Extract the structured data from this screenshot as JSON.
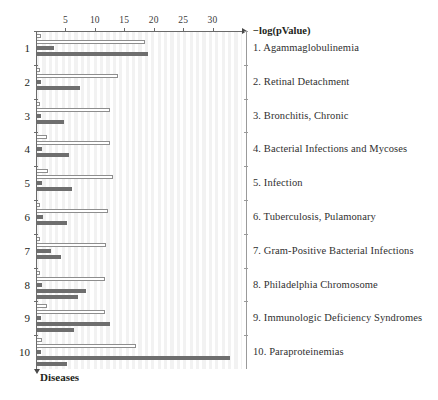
{
  "chart_data": {
    "type": "bar",
    "orientation": "horizontal",
    "title": "",
    "xlabel": "−log(pValue)",
    "ylabel": "Diseases",
    "xlim": [
      0,
      35
    ],
    "xticks": [
      5,
      10,
      15,
      20,
      25,
      30
    ],
    "grid": true,
    "grid_style": "vertical-stripes",
    "legend_position": "right-as-category-list",
    "categories": [
      "1. Agammaglobulinemia",
      "2. Retinal Detachment",
      "3. Bronchitis, Chronic",
      "4. Bacterial Infections and Mycoses",
      "5. Infection",
      "6. Tuberculosis, Pulamonary",
      "7. Gram-Positive Bacterial Infections",
      "8. Philadelphia Chromosome",
      "9. Immunologic Deficiency Syndromes",
      "10. Paraproteinemias"
    ],
    "group_numbers": [
      "1",
      "2",
      "3",
      "4",
      "5",
      "6",
      "7",
      "8",
      "9",
      "10"
    ],
    "series": [
      {
        "name": "series-1",
        "style": "light",
        "values": [
          0.9,
          0.7,
          0.6,
          1.9,
          2.1,
          0.6,
          0.7,
          0.6,
          1.8,
          1.0
        ]
      },
      {
        "name": "series-2",
        "style": "light",
        "values": [
          18.5,
          14.0,
          12.6,
          12.5,
          13.0,
          12.2,
          11.9,
          11.8,
          11.7,
          17.0
        ]
      },
      {
        "name": "series-3",
        "style": "dark",
        "values": [
          3.0,
          0.8,
          0.9,
          1.0,
          1.1,
          1.2,
          2.6,
          1.0,
          0.9,
          0.9
        ]
      },
      {
        "name": "series-4",
        "style": "dark",
        "values": [
          19.0,
          7.5,
          4.7,
          5.6,
          6.2,
          5.2,
          4.3,
          8.5,
          12.5,
          33.0
        ]
      }
    ],
    "extra_bars": [
      {
        "group": 8,
        "style": "dark",
        "value": 7.2
      },
      {
        "group": 9,
        "style": "dark",
        "value": 6.4
      },
      {
        "group": 10,
        "style": "dark",
        "value": 5.3
      }
    ],
    "colors": {
      "bar_light_fill": "#ffffff",
      "bar_light_stroke": "#8e8e8e",
      "bar_dark_fill": "#6e6e6e",
      "axis": "#6b6b6b",
      "stripe": "#f2f2f2",
      "text": "#231f20"
    }
  },
  "axis": {
    "x_title": "−log(pValue)",
    "y_title": "Diseases",
    "tick_labels": [
      "5",
      "10",
      "15",
      "20",
      "25",
      "30"
    ]
  }
}
